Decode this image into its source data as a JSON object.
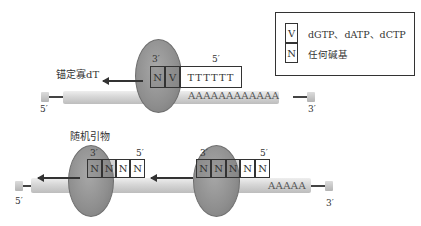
{
  "legend": {
    "items": [
      {
        "symbol": "V",
        "text": "dGTP、dATP、dCTP"
      },
      {
        "symbol": "N",
        "text": "任何碱基"
      }
    ]
  },
  "top_panel": {
    "label": "锚定寡dT",
    "primer_boxes": [
      "N",
      "V"
    ],
    "primer_tail": "TTTTTT",
    "prime_3": "3′",
    "prime_5_primer": "5′",
    "template_polyA": "AAAAAAAAAAAA",
    "template_5": "5′",
    "template_3": "3′"
  },
  "bottom_panel": {
    "label": "随机引物",
    "primer1_boxes": [
      "N",
      "N",
      "N",
      "N"
    ],
    "primer2_boxes": [
      "N",
      "N",
      "N",
      "N",
      "N"
    ],
    "prime_3": "3′",
    "prime_5": "5′",
    "template_polyA": "AAAAA",
    "template_5": "5′",
    "template_3": "3′"
  },
  "colors": {
    "enzyme": "#8f8f8f",
    "strand": "#d0d0d0",
    "outline": "#333333"
  }
}
